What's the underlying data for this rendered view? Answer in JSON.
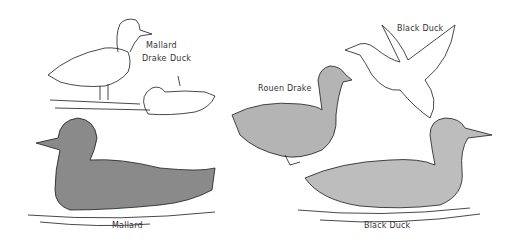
{
  "illustration": {
    "labels": {
      "mallard_top": "Mallard",
      "drake": "Drake",
      "duck": "Duck",
      "black_duck_flying": "Black Duck",
      "rouen_drake": "Rouen Drake",
      "mallard_bottom": "Mallard",
      "black_duck_swimming": "Black Duck"
    },
    "colors": {
      "background": "#ffffff",
      "ink": "#1a1a1a"
    }
  }
}
